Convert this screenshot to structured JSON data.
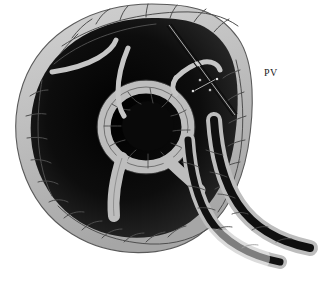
{
  "figure": {
    "domain": "anatomical-illustration",
    "caption_rule_visible": true,
    "background_color": "#ffffff",
    "width": 330,
    "height": 290
  },
  "labels": [
    {
      "id": "pv",
      "text": "PV",
      "x": 264,
      "y": 72,
      "anchor_structure": "portal-vein"
    }
  ],
  "annotations": {
    "leader_line": {
      "name": "needle-probe",
      "x1": 167,
      "y1": 26,
      "x2": 233,
      "y2": 116,
      "color": "#101010",
      "marker_x": 205,
      "marker_y": 85,
      "marker_label": "clip-marker"
    }
  },
  "palette": {
    "tissue_light": "#c2c2c2",
    "tissue_mid": "#9a9a9a",
    "tissue_outline": "#4a4a4a",
    "lumen_dark": "#141414",
    "lumen_shadow": "#2b2b2b",
    "ridge_highlight": "#cfcfcf",
    "rule_color": "#8c8c8c",
    "text_color": "#1a1a1a"
  },
  "rule": {
    "name": "caption-divider",
    "x1": 48,
    "x2": 318,
    "y": 283,
    "thickness": 2
  },
  "structures": [
    {
      "name": "outer-capsule-rim",
      "description": "light gray cracked tissue band forming the outer oval boundary"
    },
    {
      "name": "central-lumen",
      "description": "large dark cavity occupying the interior"
    },
    {
      "name": "central-ring",
      "description": "small ring of tissue enclosing a dark round lumen near center"
    },
    {
      "name": "upper-left-ridge",
      "description": "thin light curved ridge in the upper-left dark field"
    },
    {
      "name": "upper-mid-ridge",
      "description": "thin light curved ridge descending to the central ring"
    },
    {
      "name": "right-tubular-branch",
      "description": "tubular vessel descending to lower right, fading out"
    },
    {
      "name": "lower-tubular-branch",
      "description": "second tubular vessel curving toward bottom right"
    }
  ]
}
